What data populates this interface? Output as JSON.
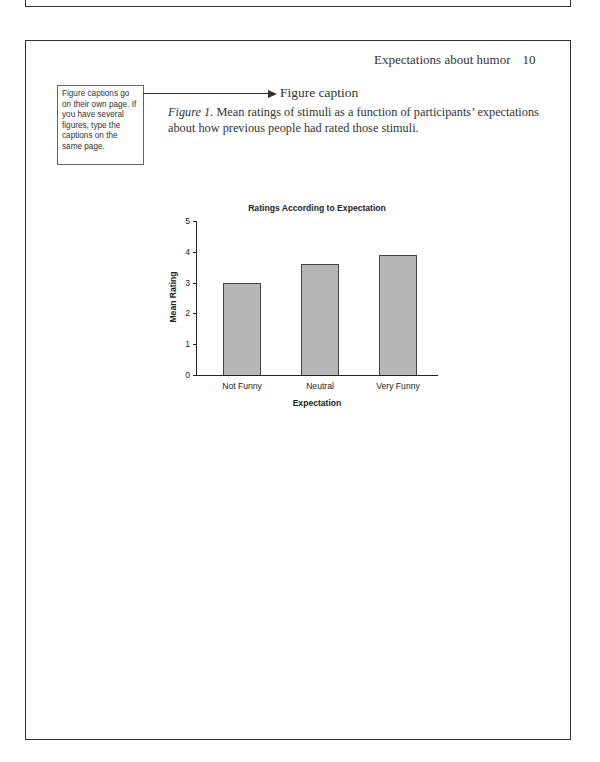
{
  "running_head": {
    "title": "Expectations about humor",
    "page_number": "10"
  },
  "callout": {
    "text": "Figure captions go on their own page. If you have several figures, type the captions on the same page."
  },
  "arrow_label": "Figure caption",
  "caption": {
    "figure_label": "Figure 1.",
    "text": " Mean ratings of stimuli as a function of participants’ expectations about how previous people had rated those stimuli."
  },
  "chart_data": {
    "type": "bar",
    "title": "Ratings According to Expectation",
    "xlabel": "Expectation",
    "ylabel": "Mean Rating",
    "categories": [
      "Not Funny",
      "Neutral",
      "Very Funny"
    ],
    "values": [
      3.0,
      3.6,
      3.9
    ],
    "ylim": [
      0,
      5
    ],
    "yticks": [
      "0",
      "1",
      "2",
      "3",
      "4",
      "5"
    ],
    "grid": false,
    "legend": null,
    "bar_fill": "#b6b6b6"
  }
}
